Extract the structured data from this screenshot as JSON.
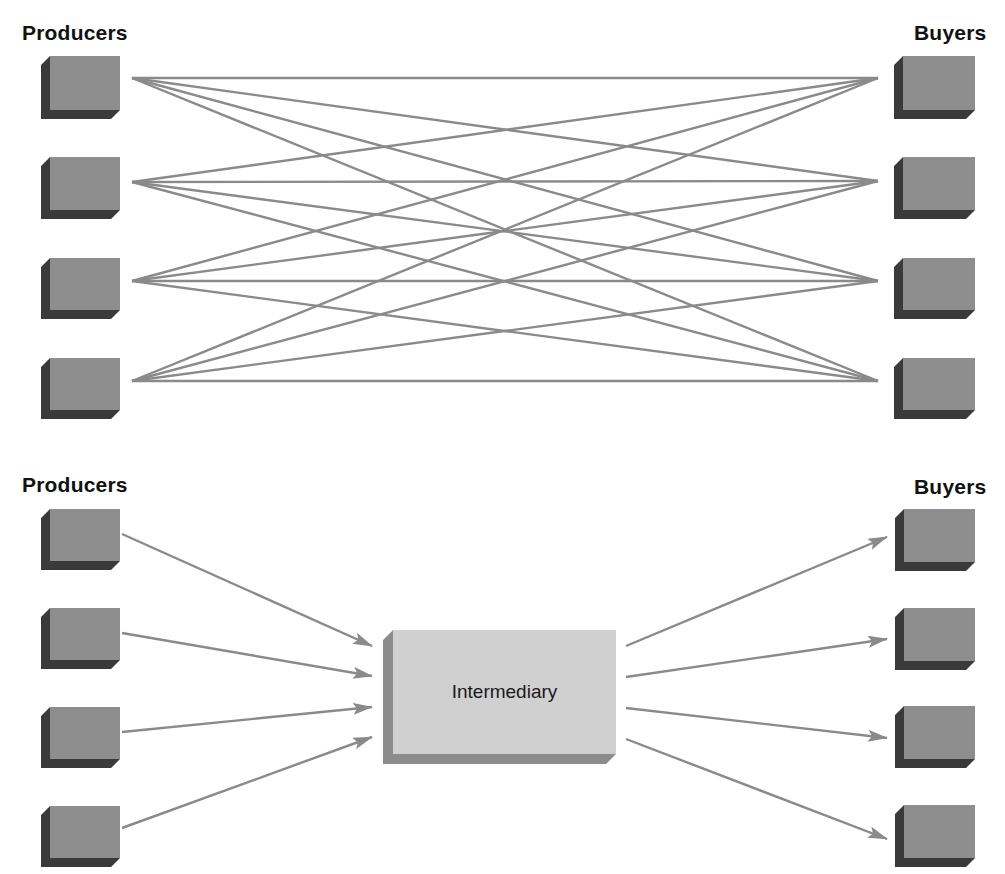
{
  "top_section": {
    "producers_label": "Producers",
    "buyers_label": "Buyers",
    "description": "Direct exchange: every producer connects to every buyer",
    "producers_count": 4,
    "buyers_count": 4,
    "connection_count": 16
  },
  "bottom_section": {
    "producers_label": "Producers",
    "buyers_label": "Buyers",
    "intermediary_label": "Intermediary",
    "description": "Indirect exchange through an intermediary",
    "producers_count": 4,
    "buyers_count": 4,
    "connection_count": 8
  },
  "colors": {
    "box_face": "#8e8e8e",
    "box_shadow": "#3a3a3a",
    "intermediary_face": "#d0d0d0",
    "intermediary_shadow": "#8c8c8c",
    "line": "#8a8a8a",
    "label": "#111111"
  }
}
